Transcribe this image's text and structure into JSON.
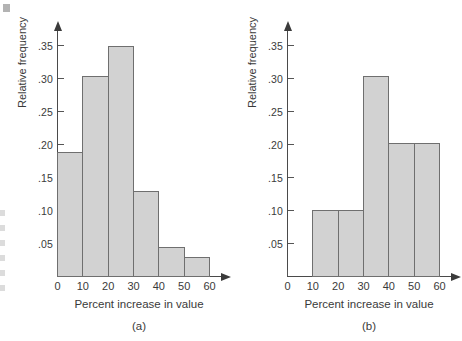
{
  "figure": {
    "background_color": "#ffffff",
    "bar_fill_color": "#d2d2d2",
    "bar_edge_color": "#6f6f6f",
    "axis_color": "#4a4a4a",
    "text_color": "#3a3a3a"
  },
  "chart_data": [
    {
      "type": "bar",
      "panel": "(a)",
      "title": "",
      "xlabel": "Percent increase in value",
      "ylabel": "Relative frequency",
      "xlim": [
        0,
        60
      ],
      "ylim": [
        0,
        0.375
      ],
      "grid": false,
      "legend": null,
      "xticks": [
        0,
        10,
        20,
        30,
        40,
        50,
        60
      ],
      "xtick_labels": [
        "0",
        "10",
        "20",
        "30",
        "40",
        "50",
        "60"
      ],
      "yticks": [
        0.05,
        0.1,
        0.15,
        0.2,
        0.25,
        0.3,
        0.35
      ],
      "ytick_labels": [
        ".05",
        ".10",
        ".15",
        ".20",
        ".25",
        ".30",
        ".35"
      ],
      "bin_edges": [
        0,
        10,
        20,
        30,
        40,
        50,
        60
      ],
      "categories": [
        "0-10",
        "10-20",
        "20-30",
        "30-40",
        "40-50",
        "50-60"
      ],
      "values": [
        0.19,
        0.305,
        0.35,
        0.13,
        0.045,
        0.03
      ]
    },
    {
      "type": "bar",
      "panel": "(b)",
      "title": "",
      "xlabel": "Percent increase in value",
      "ylabel": "Relative frequency",
      "xlim": [
        0,
        60
      ],
      "ylim": [
        0,
        0.375
      ],
      "grid": false,
      "legend": null,
      "xticks": [
        0,
        10,
        20,
        30,
        40,
        50,
        60
      ],
      "xtick_labels": [
        "0",
        "10",
        "20",
        "30",
        "40",
        "50",
        "60"
      ],
      "yticks": [
        0.05,
        0.1,
        0.15,
        0.2,
        0.25,
        0.3,
        0.35
      ],
      "ytick_labels": [
        ".05",
        ".10",
        ".15",
        ".20",
        ".25",
        ".30",
        ".35"
      ],
      "bin_edges": [
        10,
        20,
        30,
        40,
        50,
        60
      ],
      "categories": [
        "10-20",
        "20-30",
        "30-40",
        "40-50",
        "50-60"
      ],
      "values": [
        0.102,
        0.102,
        0.305,
        0.203,
        0.203
      ]
    }
  ]
}
